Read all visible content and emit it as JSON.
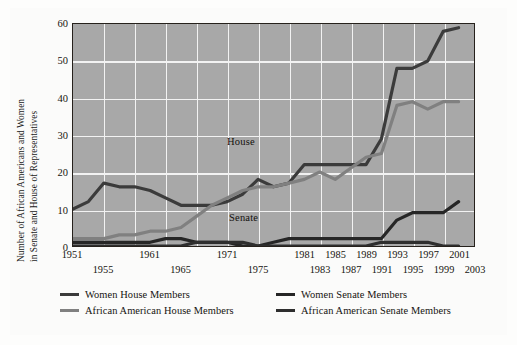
{
  "chart_data": {
    "type": "line",
    "title": "",
    "subtitle": "",
    "xlabel": "",
    "ylabel": "Number of African Americans and Women in Senate and House of Representatives",
    "ylabel_line1": "Number of African Americans and Women",
    "ylabel_line2": "in Senate and House of Representatives",
    "xlim": [
      1951,
      2003
    ],
    "ylim": [
      0,
      60
    ],
    "yticks": [
      0,
      10,
      20,
      30,
      40,
      50,
      60
    ],
    "xticks_row_top": [
      "1951",
      "1961",
      "1971",
      "1981",
      "1985",
      "1989",
      "1993",
      "1997",
      "2001"
    ],
    "xticks_row_bottom": [
      "1955",
      "1965",
      "1975",
      "1983",
      "1987",
      "1991",
      "1995",
      "1999",
      "2003"
    ],
    "xticks": [
      {
        "label": "1951",
        "value": 1951,
        "row": 0
      },
      {
        "label": "1955",
        "value": 1955,
        "row": 1
      },
      {
        "label": "1961",
        "value": 1961,
        "row": 0
      },
      {
        "label": "1965",
        "value": 1965,
        "row": 1
      },
      {
        "label": "1971",
        "value": 1971,
        "row": 0
      },
      {
        "label": "1975",
        "value": 1975,
        "row": 1
      },
      {
        "label": "1981",
        "value": 1981,
        "row": 0
      },
      {
        "label": "1983",
        "value": 1983,
        "row": 1
      },
      {
        "label": "1985",
        "value": 1985,
        "row": 0
      },
      {
        "label": "1987",
        "value": 1987,
        "row": 1
      },
      {
        "label": "1989",
        "value": 1989,
        "row": 0
      },
      {
        "label": "1991",
        "value": 1991,
        "row": 1
      },
      {
        "label": "1993",
        "value": 1993,
        "row": 0
      },
      {
        "label": "1995",
        "value": 1995,
        "row": 1
      },
      {
        "label": "1997",
        "value": 1997,
        "row": 0
      },
      {
        "label": "1999",
        "value": 1999,
        "row": 1
      },
      {
        "label": "2001",
        "value": 2001,
        "row": 0
      },
      {
        "label": "2003",
        "value": 2003,
        "row": 1
      }
    ],
    "gridlines": {
      "vertical_values": [
        1955,
        1959,
        1963,
        1967,
        1971,
        1975,
        1979,
        1983,
        1987,
        1991,
        1995,
        1999,
        2003
      ],
      "horizontal_values": [
        10,
        20,
        30,
        40,
        50
      ],
      "grid": true,
      "grid_color": "#f2f2f2"
    },
    "plot_background": "#a8a8a8",
    "legend_position": "below-plot",
    "x": [
      1951,
      1953,
      1955,
      1957,
      1959,
      1961,
      1963,
      1965,
      1967,
      1969,
      1971,
      1973,
      1975,
      1977,
      1979,
      1981,
      1983,
      1985,
      1987,
      1989,
      1991,
      1993,
      1995,
      1997,
      1999,
      2001
    ],
    "series": [
      {
        "name": "Women House Members",
        "color": "#3b3b3b",
        "values": [
          10,
          12,
          17,
          16,
          16,
          15,
          13,
          11,
          11,
          11,
          12,
          14,
          18,
          16,
          17,
          22,
          22,
          22,
          22,
          22,
          29,
          48,
          48,
          50,
          58,
          59
        ]
      },
      {
        "name": "African American House Members",
        "color": "#808080",
        "values": [
          2,
          2,
          2,
          3,
          3,
          4,
          4,
          5,
          8,
          11,
          13,
          15,
          16,
          16,
          17,
          18,
          20,
          18,
          21,
          24,
          25,
          38,
          39,
          37,
          39,
          39
        ]
      },
      {
        "name": "Women Senate Members",
        "color": "#262626",
        "values": [
          1,
          1,
          1,
          1,
          1,
          1,
          2,
          2,
          1,
          1,
          1,
          0,
          0,
          1,
          2,
          2,
          2,
          2,
          2,
          2,
          2,
          7,
          9,
          9,
          9,
          12
        ]
      },
      {
        "name": "African American Senate Members",
        "color": "#2e2e2e",
        "values": [
          0,
          0,
          0,
          0,
          0,
          0,
          0,
          0,
          1,
          1,
          1,
          1,
          0,
          0,
          0,
          0,
          0,
          0,
          0,
          0,
          1,
          1,
          1,
          1,
          0,
          0
        ]
      }
    ],
    "annotations": [
      {
        "text": "House",
        "x": 1985,
        "y": 25
      },
      {
        "text": "Senate",
        "x": 1985,
        "y": 6
      }
    ]
  },
  "legend": {
    "items": [
      {
        "label": "Women House Members",
        "color": "#3b3b3b"
      },
      {
        "label": "African American House Members",
        "color": "#808080"
      },
      {
        "label": "Women Senate Members",
        "color": "#262626"
      },
      {
        "label": "African American Senate Members",
        "color": "#2e2e2e"
      }
    ]
  },
  "annotations": {
    "house": "House",
    "senate": "Senate"
  }
}
